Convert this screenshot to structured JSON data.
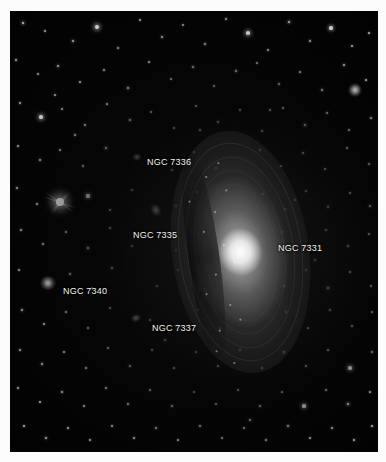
{
  "image": {
    "kind": "astrophotograph",
    "background_color": "#fcfcfc",
    "sky_color": "#010101",
    "frame": {
      "left": 10,
      "top": 11,
      "width": 368,
      "height": 441
    }
  },
  "labels": [
    {
      "text": "NGC 7336",
      "x": 147,
      "y": 158,
      "name": "label-ngc-7336"
    },
    {
      "text": "NGC 7335",
      "x": 133,
      "y": 231,
      "name": "label-ngc-7335"
    },
    {
      "text": "NGC 7331",
      "x": 278,
      "y": 244,
      "name": "label-ngc-7331"
    },
    {
      "text": "NGC 7340",
      "x": 63,
      "y": 287,
      "name": "label-ngc-7340"
    },
    {
      "text": "NGC 7337",
      "x": 152,
      "y": 324,
      "name": "label-ngc-7337"
    }
  ],
  "galaxies": [
    {
      "id": "ngc-7331",
      "label": "NGC 7331",
      "cx": 240,
      "cy": 252,
      "rx": 36,
      "ry": 122,
      "angle": -8,
      "type": "spiral-inclined"
    },
    {
      "id": "ngc-7335",
      "label": "NGC 7335",
      "cx": 156,
      "cy": 210,
      "rx": 8,
      "ry": 14,
      "angle": -28,
      "type": "lenticular"
    },
    {
      "id": "ngc-7336",
      "label": "NGC 7336",
      "cx": 137,
      "cy": 157,
      "rx": 7,
      "ry": 6,
      "angle": 0,
      "type": "faint-spiral"
    },
    {
      "id": "ngc-7337",
      "label": "NGC 7337",
      "cx": 136,
      "cy": 318,
      "rx": 9,
      "ry": 7,
      "angle": -15,
      "type": "barred-spiral"
    },
    {
      "id": "ngc-7340",
      "label": "NGC 7340",
      "cx": 48,
      "cy": 283,
      "rx": 8,
      "ry": 7,
      "angle": 0,
      "type": "elliptical"
    }
  ],
  "bright_star": {
    "cx": 60,
    "cy": 202,
    "radius": 4,
    "spike_length": 34,
    "name": "bright-star-diffraction"
  },
  "fuzzy_blob": {
    "cx": 355,
    "cy": 90,
    "radius": 7
  },
  "stars": [
    [
      23,
      23,
      1.6
    ],
    [
      45,
      31,
      0.9
    ],
    [
      73,
      41,
      1.4
    ],
    [
      97,
      27,
      2.4
    ],
    [
      118,
      48,
      1.1
    ],
    [
      140,
      20,
      1.0
    ],
    [
      162,
      37,
      1.3
    ],
    [
      183,
      25,
      0.9
    ],
    [
      205,
      44,
      1.2
    ],
    [
      226,
      19,
      1.1
    ],
    [
      248,
      33,
      2.1
    ],
    [
      268,
      50,
      1.0
    ],
    [
      289,
      22,
      1.5
    ],
    [
      310,
      41,
      1.2
    ],
    [
      331,
      28,
      1.8
    ],
    [
      352,
      46,
      1.1
    ],
    [
      369,
      33,
      1.0
    ],
    [
      16,
      60,
      1.2
    ],
    [
      38,
      74,
      0.9
    ],
    [
      58,
      66,
      1.3
    ],
    [
      80,
      82,
      1.0
    ],
    [
      104,
      70,
      1.1
    ],
    [
      128,
      88,
      1.5
    ],
    [
      149,
      62,
      1.0
    ],
    [
      171,
      79,
      0.9
    ],
    [
      193,
      67,
      1.2
    ],
    [
      214,
      86,
      1.0
    ],
    [
      236,
      71,
      1.4
    ],
    [
      257,
      63,
      0.9
    ],
    [
      279,
      84,
      1.1
    ],
    [
      300,
      72,
      1.0
    ],
    [
      322,
      90,
      1.3
    ],
    [
      344,
      65,
      1.2
    ],
    [
      366,
      80,
      1.0
    ],
    [
      20,
      103,
      1.1
    ],
    [
      41,
      117,
      2.2
    ],
    [
      62,
      109,
      0.9
    ],
    [
      85,
      125,
      1.2
    ],
    [
      107,
      104,
      1.0
    ],
    [
      130,
      120,
      1.4
    ],
    [
      151,
      112,
      0.9
    ],
    [
      174,
      128,
      1.1
    ],
    [
      196,
      106,
      1.0
    ],
    [
      218,
      122,
      1.3
    ],
    [
      240,
      110,
      0.9
    ],
    [
      262,
      131,
      1.2
    ],
    [
      283,
      108,
      1.0
    ],
    [
      305,
      125,
      1.6
    ],
    [
      327,
      113,
      1.1
    ],
    [
      349,
      130,
      1.0
    ],
    [
      371,
      118,
      1.2
    ],
    [
      18,
      146,
      1.0
    ],
    [
      40,
      160,
      1.3
    ],
    [
      60,
      150,
      0.9
    ],
    [
      83,
      166,
      1.1
    ],
    [
      106,
      148,
      1.5
    ],
    [
      172,
      170,
      1.0
    ],
    [
      194,
      152,
      0.9
    ],
    [
      216,
      168,
      1.1
    ],
    [
      260,
      150,
      1.2
    ],
    [
      281,
      166,
      1.0
    ],
    [
      303,
      153,
      1.4
    ],
    [
      325,
      169,
      1.0
    ],
    [
      347,
      148,
      1.1
    ],
    [
      369,
      164,
      0.9
    ],
    [
      17,
      188,
      1.1
    ],
    [
      37,
      204,
      1.0
    ],
    [
      88,
      196,
      1.8
    ],
    [
      110,
      210,
      1.0
    ],
    [
      132,
      190,
      0.9
    ],
    [
      176,
      206,
      1.2
    ],
    [
      197,
      192,
      1.0
    ],
    [
      219,
      208,
      0.9
    ],
    [
      263,
      194,
      1.1
    ],
    [
      285,
      209,
      1.3
    ],
    [
      306,
      191,
      1.0
    ],
    [
      328,
      207,
      1.2
    ],
    [
      350,
      193,
      1.0
    ],
    [
      370,
      206,
      1.4
    ],
    [
      21,
      230,
      1.2
    ],
    [
      43,
      244,
      1.0
    ],
    [
      66,
      232,
      1.1
    ],
    [
      88,
      248,
      1.6
    ],
    [
      110,
      228,
      1.0
    ],
    [
      132,
      246,
      1.1
    ],
    [
      176,
      250,
      0.9
    ],
    [
      198,
      234,
      1.0
    ],
    [
      220,
      248,
      1.2
    ],
    [
      282,
      232,
      1.1
    ],
    [
      304,
      248,
      1.5
    ],
    [
      326,
      230,
      1.0
    ],
    [
      348,
      246,
      1.2
    ],
    [
      369,
      234,
      1.0
    ],
    [
      19,
      270,
      1.1
    ],
    [
      70,
      274,
      1.2
    ],
    [
      92,
      288,
      1.0
    ],
    [
      112,
      268,
      1.3
    ],
    [
      157,
      286,
      1.0
    ],
    [
      178,
      270,
      1.1
    ],
    [
      200,
      288,
      0.9
    ],
    [
      222,
      272,
      1.0
    ],
    [
      284,
      286,
      1.2
    ],
    [
      306,
      270,
      1.0
    ],
    [
      328,
      288,
      1.7
    ],
    [
      350,
      272,
      1.1
    ],
    [
      371,
      286,
      1.0
    ],
    [
      22,
      310,
      1.3
    ],
    [
      44,
      324,
      1.0
    ],
    [
      66,
      312,
      1.1
    ],
    [
      88,
      328,
      1.2
    ],
    [
      110,
      308,
      1.0
    ],
    [
      176,
      326,
      1.1
    ],
    [
      198,
      310,
      0.9
    ],
    [
      220,
      328,
      1.0
    ],
    [
      286,
      312,
      1.4
    ],
    [
      308,
      328,
      1.0
    ],
    [
      330,
      310,
      1.2
    ],
    [
      352,
      326,
      1.1
    ],
    [
      372,
      312,
      1.0
    ],
    [
      20,
      350,
      1.0
    ],
    [
      42,
      364,
      1.2
    ],
    [
      64,
      352,
      0.9
    ],
    [
      86,
      368,
      1.1
    ],
    [
      108,
      348,
      1.0
    ],
    [
      130,
      366,
      1.3
    ],
    [
      152,
      350,
      0.9
    ],
    [
      174,
      368,
      1.0
    ],
    [
      196,
      352,
      1.1
    ],
    [
      218,
      366,
      1.0
    ],
    [
      240,
      350,
      1.2
    ],
    [
      262,
      368,
      1.0
    ],
    [
      284,
      352,
      1.5
    ],
    [
      306,
      366,
      1.1
    ],
    [
      328,
      350,
      1.0
    ],
    [
      350,
      368,
      2.0
    ],
    [
      372,
      352,
      1.1
    ],
    [
      18,
      388,
      1.1
    ],
    [
      40,
      402,
      1.0
    ],
    [
      62,
      392,
      1.2
    ],
    [
      84,
      406,
      0.9
    ],
    [
      106,
      388,
      1.0
    ],
    [
      128,
      404,
      1.1
    ],
    [
      150,
      390,
      1.0
    ],
    [
      172,
      406,
      1.2
    ],
    [
      194,
      392,
      0.9
    ],
    [
      216,
      404,
      1.0
    ],
    [
      238,
      390,
      1.1
    ],
    [
      260,
      406,
      1.3
    ],
    [
      282,
      392,
      1.0
    ],
    [
      304,
      406,
      1.8
    ],
    [
      326,
      390,
      1.1
    ],
    [
      348,
      404,
      1.6
    ],
    [
      370,
      392,
      1.0
    ],
    [
      24,
      426,
      1.0
    ],
    [
      46,
      438,
      1.2
    ],
    [
      68,
      428,
      1.0
    ],
    [
      90,
      440,
      1.1
    ],
    [
      112,
      426,
      0.9
    ],
    [
      134,
      438,
      1.0
    ],
    [
      156,
      428,
      1.1
    ],
    [
      178,
      440,
      1.0
    ],
    [
      200,
      426,
      1.2
    ],
    [
      222,
      438,
      0.9
    ],
    [
      244,
      428,
      1.0
    ],
    [
      266,
      440,
      1.1
    ],
    [
      288,
      426,
      1.4
    ],
    [
      310,
      438,
      1.0
    ],
    [
      332,
      428,
      1.2
    ],
    [
      354,
      440,
      1.1
    ],
    [
      372,
      426,
      1.0
    ],
    [
      55,
      95,
      1.0
    ],
    [
      75,
      135,
      1.1
    ],
    [
      150,
      320,
      1.0
    ],
    [
      165,
      340,
      1.2
    ],
    [
      205,
      290,
      1.0
    ],
    [
      295,
      200,
      1.1
    ],
    [
      315,
      260,
      1.2
    ],
    [
      250,
      420,
      1.3
    ],
    [
      200,
      130,
      1.0
    ],
    [
      270,
      110,
      1.2
    ]
  ]
}
